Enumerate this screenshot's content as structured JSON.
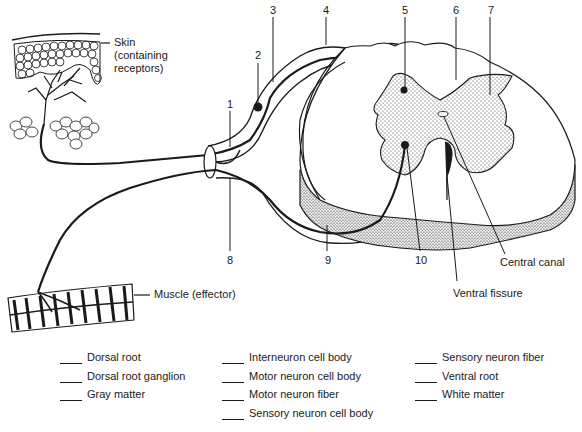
{
  "callouts": {
    "skin": [
      "Skin",
      "(containing",
      "receptors)"
    ],
    "muscle": "Muscle (effector)",
    "central_canal": "Central canal",
    "ventral_fissure": "Ventral fissure"
  },
  "numbers": [
    "1",
    "2",
    "3",
    "4",
    "5",
    "6",
    "7",
    "8",
    "9",
    "10"
  ],
  "key": {
    "blank": "____",
    "col1": [
      "Dorsal root",
      "Dorsal root ganglion",
      "Gray matter"
    ],
    "col2": [
      "Interneuron cell body",
      "Motor neuron cell body",
      "Motor neuron fiber",
      "Sensory neuron cell body"
    ],
    "col3": [
      "Sensory neuron fiber",
      "Ventral root",
      "White matter"
    ]
  },
  "colors": {
    "ink": "#1a1a1a",
    "background": "#ffffff"
  }
}
